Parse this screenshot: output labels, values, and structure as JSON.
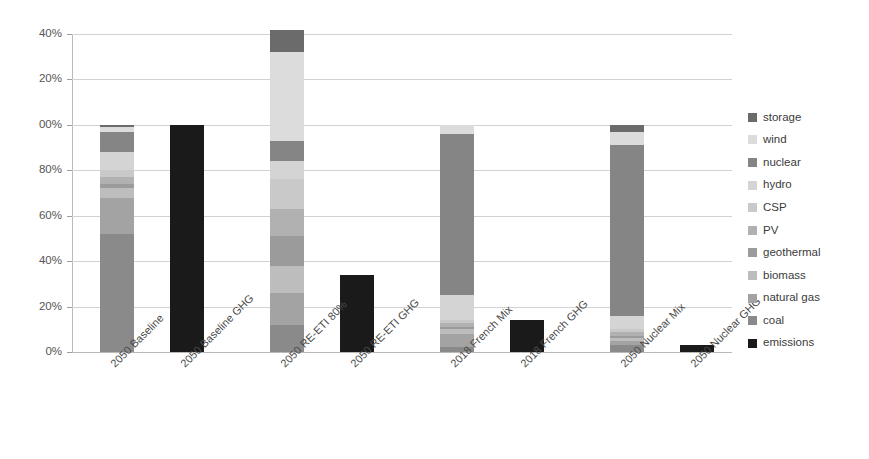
{
  "chart_data": {
    "type": "bar",
    "title": "",
    "subtitle": "",
    "xlabel": "",
    "ylabel": "",
    "stacked": true,
    "grid": true,
    "legend_position": "right",
    "ylim": [
      0,
      140
    ],
    "ytick_labels": [
      "40%",
      "20%",
      "00%",
      "80%",
      "60%",
      "40%",
      "20%",
      "0%"
    ],
    "ytick_values": [
      140,
      120,
      100,
      80,
      60,
      40,
      20,
      0
    ],
    "ytick_note": "left-most digit of 140%, 120% and 100% is clipped by the image edge",
    "categories": [
      "2050 Baseline",
      "2050 Baseline GHG",
      "2050 RE-ETI 80%",
      "2050 RE-ETI GHG",
      "2018 French Mix",
      "2018 French GHG",
      "2050 Nuclear Mix",
      "2050 Nuclear GHG"
    ],
    "series": [
      {
        "name": "coal",
        "color": "#8a8a8a",
        "values": [
          52,
          0,
          12,
          0,
          2,
          0,
          3,
          0
        ]
      },
      {
        "name": "natural gas",
        "color": "#a3a3a3",
        "values": [
          16,
          0,
          14,
          0,
          6,
          0,
          2,
          0
        ]
      },
      {
        "name": "biomass",
        "color": "#bdbdbd",
        "values": [
          4,
          0,
          12,
          0,
          2,
          0,
          1,
          0
        ]
      },
      {
        "name": "geothermal",
        "color": "#9b9b9b",
        "values": [
          2,
          0,
          13,
          0,
          1,
          0,
          1,
          0
        ]
      },
      {
        "name": "PV",
        "color": "#b1b1b1",
        "values": [
          3,
          0,
          12,
          0,
          2,
          0,
          2,
          0
        ]
      },
      {
        "name": "CSP",
        "color": "#c9c9c9",
        "values": [
          3,
          0,
          13,
          0,
          1,
          0,
          1,
          0
        ]
      },
      {
        "name": "hydro",
        "color": "#d4d4d4",
        "values": [
          8,
          0,
          8,
          0,
          11,
          0,
          6,
          0
        ]
      },
      {
        "name": "nuclear",
        "color": "#858585",
        "values": [
          9,
          0,
          9,
          0,
          71,
          0,
          75,
          0
        ]
      },
      {
        "name": "wind",
        "color": "#dcdcdc",
        "values": [
          2,
          0,
          39,
          0,
          4,
          0,
          6,
          0
        ]
      },
      {
        "name": "storage",
        "color": "#6b6b6b",
        "values": [
          1,
          0,
          10,
          0,
          0,
          0,
          3,
          0
        ]
      },
      {
        "name": "emissions",
        "color": "#1a1a1a",
        "values": [
          0,
          100,
          0,
          34,
          0,
          14,
          0,
          3
        ]
      }
    ]
  },
  "legend": {
    "items": [
      {
        "label": "storage",
        "color": "#6b6b6b"
      },
      {
        "label": "wind",
        "color": "#dcdcdc"
      },
      {
        "label": "nuclear",
        "color": "#858585"
      },
      {
        "label": "hydro",
        "color": "#d4d4d4"
      },
      {
        "label": "CSP",
        "color": "#c9c9c9"
      },
      {
        "label": "PV",
        "color": "#b1b1b1"
      },
      {
        "label": "geothermal",
        "color": "#9b9b9b"
      },
      {
        "label": "biomass",
        "color": "#bdbdbd"
      },
      {
        "label": "natural gas",
        "color": "#a3a3a3"
      },
      {
        "label": "coal",
        "color": "#8a8a8a"
      },
      {
        "label": "emissions",
        "color": "#1a1a1a"
      }
    ]
  }
}
